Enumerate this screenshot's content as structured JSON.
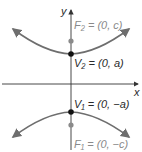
{
  "diagram": {
    "type": "hyperbola-vertical-transverse-axis",
    "axes": {
      "x_label": "x",
      "y_label": "y"
    },
    "points": {
      "F2": {
        "label": "F₂ = (0, c)",
        "role": "focus"
      },
      "V2": {
        "label": "V₂ = (0, a)",
        "role": "vertex"
      },
      "V1": {
        "label": "V₁ = (0, −a)",
        "role": "vertex"
      },
      "F1": {
        "label": "F₁ = (0, −c)",
        "role": "focus"
      }
    },
    "colors": {
      "curve": "#6e6e6e",
      "axis": "#333333",
      "vertex_point": "#111111",
      "focus_point": "#8a8a8a",
      "focus_label": "#8a8a8a",
      "vertex_label": "#2a2a2a"
    }
  }
}
